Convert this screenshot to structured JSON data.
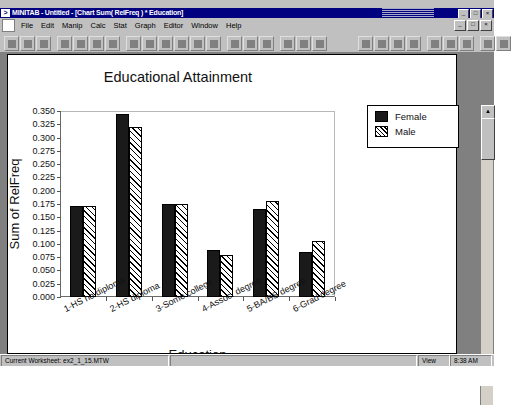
{
  "window": {
    "title": "MINITAB - Untitled - [Chart Sum( RelFreq ) * Education]",
    "app_icon": "minitab-icon",
    "minimize_label": "_",
    "maximize_label": "□",
    "close_label": "×"
  },
  "menubar": {
    "doc_icon": "document-icon",
    "items": [
      {
        "label": "File",
        "name": "menu-file"
      },
      {
        "label": "Edit",
        "name": "menu-edit"
      },
      {
        "label": "Manip",
        "name": "menu-manip"
      },
      {
        "label": "Calc",
        "name": "menu-calc"
      },
      {
        "label": "Stat",
        "name": "menu-stat"
      },
      {
        "label": "Graph",
        "name": "menu-graph"
      },
      {
        "label": "Editor",
        "name": "menu-editor"
      },
      {
        "label": "Window",
        "name": "menu-window"
      },
      {
        "label": "Help",
        "name": "menu-help"
      }
    ],
    "doc_buttons": [
      {
        "label": "_",
        "name": "doc-minimize-button"
      },
      {
        "label": "□",
        "name": "doc-restore-button"
      },
      {
        "label": "×",
        "name": "doc-close-button"
      }
    ]
  },
  "toolbar": {
    "left_buttons": [
      "new-icon",
      "open-icon",
      "save-icon",
      "print-icon",
      "cut-icon",
      "copy-icon",
      "paste-icon",
      "undo-icon",
      "session-window-icon",
      "worksheet-icon",
      "graph-window-icon",
      "history-icon",
      "project-manager-icon",
      "select-tool-icon",
      "brush-icon",
      "edit-last-icon",
      "find-icon",
      "help-pointer-icon",
      "info-icon"
    ],
    "right_buttons": [
      "font-icon",
      "align-icon",
      "zoom-in-icon",
      "zoom-out-icon",
      "grid-icon",
      "annotate-icon",
      "layout-icon",
      "snap-icon",
      "tool-icon"
    ]
  },
  "statusbar": {
    "worksheet_label": "Current Worksheet: ex2_1_15.MTW",
    "middle_label": "",
    "view_label": "View",
    "time_label": "8:38 AM"
  },
  "scrollbar": {
    "up_arrow": "▲",
    "down_arrow": "▼"
  },
  "chart_data": {
    "type": "bar",
    "title": "Educational Attainment",
    "xlabel": "Education",
    "ylabel": "Sum of RelFreq",
    "grid": false,
    "legend_position": "top-right",
    "ylim": [
      0.0,
      0.35
    ],
    "ytick_labels": [
      "0.350",
      "0.325",
      "0.300",
      "0.275",
      "0.250",
      "0.225",
      "0.200",
      "0.175",
      "0.150",
      "0.125",
      "0.100",
      "0.075",
      "0.050",
      "0.025",
      "0.000"
    ],
    "ytick_values": [
      0.35,
      0.325,
      0.3,
      0.275,
      0.25,
      0.225,
      0.2,
      0.175,
      0.15,
      0.125,
      0.1,
      0.075,
      0.05,
      0.025,
      0.0
    ],
    "categories": [
      "1-HS no diploma",
      "2-HS diploma",
      "3-Some college",
      "4-Assoc. degree",
      "5-BA/BS degree",
      "6-Grad degree"
    ],
    "series": [
      {
        "name": "Female",
        "color": "#1a1a1a",
        "fill": "solid",
        "values": [
          0.172,
          0.345,
          0.175,
          0.088,
          0.165,
          0.085
        ]
      },
      {
        "name": "Male",
        "color": "#ffffff",
        "fill": "hatched",
        "values": [
          0.172,
          0.32,
          0.175,
          0.08,
          0.18,
          0.105
        ]
      }
    ]
  }
}
